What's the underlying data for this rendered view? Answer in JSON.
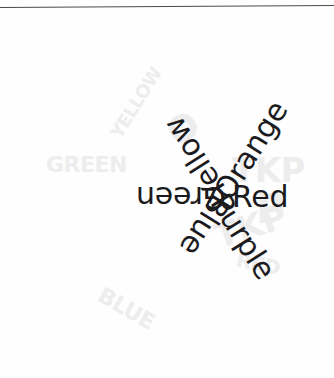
{
  "page": {
    "background_color": "#fefefe",
    "text_color": "#1b1b1d",
    "rule_color": "#4a4a4c",
    "watermark_color": "#ededee"
  },
  "diagram": {
    "type": "color-wheel-labels",
    "center_x": 170,
    "center_y": 200,
    "segment_count": 6,
    "segment_step_degrees": 60,
    "labels": [
      {
        "text": "Red",
        "angle_degrees": 0,
        "radius": 62,
        "orientation": "upright",
        "position": "right"
      },
      {
        "text": "Orange",
        "angle_degrees": -58,
        "radius": 52,
        "orientation": "rotated",
        "position": "upper-right"
      },
      {
        "text": "Yellow",
        "angle_degrees": -122,
        "radius": 50,
        "orientation": "rotated",
        "position": "upper-left"
      },
      {
        "text": "Green",
        "angle_degrees": 180,
        "radius": 56,
        "orientation": "upside-down",
        "position": "left"
      },
      {
        "text": "Blue",
        "angle_degrees": 122,
        "radius": 52,
        "orientation": "rotated",
        "position": "lower-left"
      },
      {
        "text": "Purple",
        "angle_degrees": 58,
        "radius": 48,
        "orientation": "rotated",
        "position": "lower-right"
      }
    ]
  },
  "watermarks": [
    {
      "text": "TKP",
      "left": 232,
      "top": 150,
      "size": 34,
      "rotate": 0
    },
    {
      "text": "TKP",
      "left": 214,
      "top": 206,
      "size": 34,
      "rotate": -18
    },
    {
      "text": "GREEN",
      "left": 46,
      "top": 152,
      "size": 22,
      "rotate": 0
    },
    {
      "text": "BLUE",
      "left": 96,
      "top": 296,
      "size": 22,
      "rotate": 30
    },
    {
      "text": "YELLOW",
      "left": 96,
      "top": 92,
      "size": 18,
      "rotate": -58
    },
    {
      "text": "RED",
      "left": 236,
      "top": 252,
      "size": 20,
      "rotate": 12
    },
    {
      "text": "P",
      "left": 256,
      "top": 186,
      "size": 40,
      "rotate": 0
    },
    {
      "text": "O",
      "left": 168,
      "top": 108,
      "size": 36,
      "rotate": -40
    }
  ]
}
